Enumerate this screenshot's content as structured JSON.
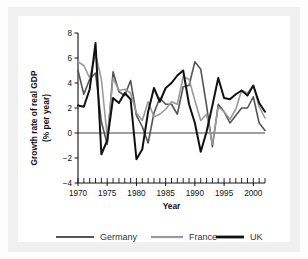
{
  "figure": {
    "background": "#ffffff",
    "frame_color": "#f0f0f0"
  },
  "chart_data": {
    "type": "line",
    "title": "",
    "xlabel": "Year",
    "ylabel": "Growth rate of real GDP\n(% per year)",
    "ylabel_line1": "Growth rate of real GDP",
    "ylabel_line2": "(% per year)",
    "xlim": [
      1970,
      2002
    ],
    "ylim": [
      -4,
      8
    ],
    "yticks": [
      8,
      6,
      4,
      2,
      0,
      -2,
      -4
    ],
    "ytick_labels": [
      "8",
      "6",
      "4",
      "2",
      "0",
      "−2",
      "−4"
    ],
    "xticks": [
      1970,
      1975,
      1980,
      1985,
      1990,
      1995,
      2000
    ],
    "xtick_labels": [
      "1970",
      "1975",
      "1980",
      "1985",
      "1990",
      "1995",
      "2000"
    ],
    "x_minor_tick_interval": 1,
    "grid": false,
    "zero_line": true,
    "legend_position": "bottom",
    "x": [
      1970,
      1971,
      1972,
      1973,
      1974,
      1975,
      1976,
      1977,
      1978,
      1979,
      1980,
      1981,
      1982,
      1983,
      1984,
      1985,
      1986,
      1987,
      1988,
      1989,
      1990,
      1991,
      1992,
      1993,
      1994,
      1995,
      1996,
      1997,
      1998,
      1999,
      2000,
      2001,
      2002
    ],
    "series": [
      {
        "name": "Germany",
        "color": "#555555",
        "width": 1.6,
        "values": [
          5.0,
          3.1,
          4.3,
          4.8,
          0.9,
          -0.9,
          4.9,
          3.3,
          3.0,
          4.2,
          1.4,
          0.5,
          -0.8,
          1.6,
          2.8,
          2.3,
          2.3,
          1.5,
          3.7,
          3.8,
          5.7,
          5.1,
          2.2,
          -1.1,
          2.3,
          1.7,
          0.8,
          1.4,
          2.0,
          2.0,
          2.9,
          0.8,
          0.2
        ]
      },
      {
        "name": "France",
        "color": "#9a9a9a",
        "width": 1.6,
        "values": [
          5.7,
          5.4,
          4.4,
          6.3,
          4.3,
          -0.3,
          4.4,
          3.4,
          3.5,
          3.2,
          1.6,
          1.0,
          2.5,
          1.3,
          1.5,
          1.9,
          2.5,
          2.3,
          4.5,
          4.3,
          2.6,
          1.0,
          1.5,
          -0.9,
          2.1,
          1.7,
          1.1,
          1.9,
          3.4,
          3.2,
          3.8,
          2.1,
          1.2
        ]
      },
      {
        "name": "UK",
        "color": "#111111",
        "width": 2.0,
        "values": [
          2.2,
          2.1,
          3.5,
          7.2,
          -1.7,
          -0.6,
          2.8,
          2.4,
          3.2,
          2.7,
          -2.1,
          -1.3,
          1.7,
          3.6,
          2.5,
          3.6,
          4.0,
          4.6,
          5.0,
          2.3,
          0.8,
          -1.5,
          0.1,
          2.2,
          4.4,
          2.8,
          2.7,
          3.1,
          3.4,
          3.0,
          3.8,
          2.4,
          1.7
        ]
      }
    ],
    "legend": [
      {
        "label": "Germany",
        "color": "#555555",
        "width": 2.2
      },
      {
        "label": "France",
        "color": "#9a9a9a",
        "width": 2.2
      },
      {
        "label": "UK",
        "color": "#111111",
        "width": 2.8
      }
    ]
  }
}
